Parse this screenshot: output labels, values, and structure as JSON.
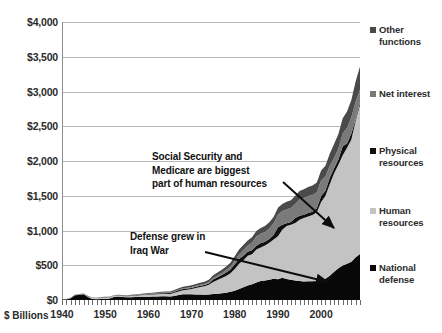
{
  "chart_data": {
    "type": "area",
    "stacked": true,
    "title": "",
    "subtitle": "",
    "xlabel": "",
    "ylabel": "$ Billions",
    "units_label": "$ Billions",
    "grid": true,
    "legend_position": "right",
    "xlim": [
      1940,
      2009
    ],
    "ylim": [
      0,
      4000
    ],
    "ytick_step": 500,
    "ytick_labels": [
      "$4,000",
      "$3,500",
      "$3,000",
      "$2,500",
      "$2,000",
      "$1,500",
      "$1,000",
      "$500",
      "$0"
    ],
    "ytick_values": [
      4000,
      3500,
      3000,
      2500,
      2000,
      1500,
      1000,
      500,
      0
    ],
    "xtick_labels": [
      "1940",
      "1950",
      "1960",
      "1970",
      "1980",
      "1990",
      "2000"
    ],
    "xtick_values": [
      1940,
      1950,
      1960,
      1970,
      1980,
      1990,
      2000
    ],
    "x": [
      1940,
      1941,
      1942,
      1943,
      1944,
      1945,
      1946,
      1947,
      1948,
      1949,
      1950,
      1951,
      1952,
      1953,
      1954,
      1955,
      1956,
      1957,
      1958,
      1959,
      1960,
      1961,
      1962,
      1963,
      1964,
      1965,
      1966,
      1967,
      1968,
      1969,
      1970,
      1971,
      1972,
      1973,
      1974,
      1975,
      1976,
      1977,
      1978,
      1979,
      1980,
      1981,
      1982,
      1983,
      1984,
      1985,
      1986,
      1987,
      1988,
      1989,
      1990,
      1991,
      1992,
      1993,
      1994,
      1995,
      1996,
      1997,
      1998,
      1999,
      2000,
      2001,
      2002,
      2003,
      2004,
      2005,
      2006,
      2007,
      2008,
      2009
    ],
    "series": [
      {
        "name": "National defense",
        "color": "#080808",
        "stack_order": 1,
        "values": [
          2,
          6,
          24,
          63,
          76,
          83,
          43,
          14,
          11,
          13,
          13,
          22,
          44,
          49,
          43,
          40,
          40,
          43,
          45,
          46,
          48,
          49,
          52,
          53,
          55,
          51,
          59,
          72,
          82,
          82,
          82,
          79,
          79,
          77,
          80,
          87,
          90,
          97,
          105,
          118,
          134,
          158,
          185,
          210,
          227,
          253,
          273,
          282,
          290,
          304,
          300,
          320,
          303,
          292,
          282,
          273,
          266,
          271,
          269,
          275,
          295,
          306,
          349,
          405,
          456,
          495,
          522,
          551,
          616,
          661
        ]
      },
      {
        "name": "Human resources",
        "color": "#c3c3c3",
        "stack_order": 2,
        "values": [
          4,
          4,
          3,
          3,
          2,
          2,
          9,
          13,
          13,
          18,
          21,
          13,
          12,
          13,
          14,
          15,
          17,
          19,
          23,
          26,
          26,
          30,
          32,
          33,
          35,
          36,
          44,
          52,
          60,
          67,
          76,
          93,
          109,
          120,
          138,
          173,
          198,
          221,
          242,
          267,
          313,
          362,
          388,
          426,
          432,
          472,
          482,
          503,
          534,
          568,
          619,
          690,
          760,
          792,
          827,
          880,
          913,
          930,
          954,
          987,
          1115,
          1194,
          1318,
          1420,
          1489,
          1586,
          1670,
          1760,
          1962,
          2150
        ]
      },
      {
        "name": "Physical resources",
        "color": "#0f0f0f",
        "stack_order": 3,
        "values": [
          1,
          1,
          1,
          1,
          1,
          1,
          1,
          1,
          1,
          2,
          3,
          3,
          3,
          3,
          3,
          3,
          4,
          5,
          6,
          7,
          8,
          9,
          10,
          11,
          11,
          12,
          14,
          15,
          17,
          17,
          16,
          18,
          18,
          19,
          21,
          35,
          39,
          42,
          49,
          53,
          66,
          70,
          63,
          58,
          57,
          57,
          61,
          54,
          53,
          62,
          126,
          74,
          40,
          39,
          71,
          60,
          47,
          52,
          48,
          58,
          85,
          73,
          92,
          70,
          75,
          131,
          61,
          83,
          26,
          30
        ]
      },
      {
        "name": "Net interest",
        "color": "#7a7a7a",
        "stack_order": 4,
        "values": [
          1,
          1,
          1,
          2,
          2,
          3,
          4,
          4,
          4,
          4,
          4,
          4,
          4,
          5,
          5,
          5,
          5,
          5,
          5,
          6,
          7,
          7,
          7,
          8,
          8,
          8,
          9,
          10,
          11,
          12,
          14,
          14,
          15,
          17,
          21,
          23,
          27,
          30,
          35,
          43,
          53,
          69,
          85,
          90,
          111,
          130,
          136,
          139,
          152,
          169,
          184,
          195,
          199,
          199,
          203,
          232,
          241,
          244,
          241,
          230,
          223,
          206,
          171,
          153,
          160,
          184,
          227,
          237,
          253,
          187
        ]
      },
      {
        "name": "Other functions",
        "color": "#4a4a4a",
        "stack_order": 5,
        "values": [
          1,
          2,
          3,
          5,
          6,
          6,
          5,
          4,
          4,
          5,
          6,
          6,
          7,
          7,
          7,
          7,
          8,
          8,
          9,
          10,
          10,
          11,
          12,
          13,
          14,
          15,
          17,
          19,
          21,
          22,
          23,
          25,
          27,
          29,
          32,
          37,
          41,
          45,
          50,
          55,
          62,
          67,
          70,
          71,
          76,
          81,
          83,
          85,
          88,
          93,
          98,
          104,
          110,
          112,
          118,
          124,
          127,
          130,
          134,
          139,
          145,
          152,
          175,
          195,
          208,
          220,
          232,
          248,
          290,
          333
        ]
      }
    ],
    "annotations": [
      {
        "id": "human-resources-note",
        "text": "Social Security and\nMedicare are biggest\npart of  human resources",
        "arrow_from": [
          283,
          182
        ],
        "arrow_to": [
          334,
          228
        ]
      },
      {
        "id": "defense-note",
        "text": "Defense grew in\nIraq War",
        "arrow_from": [
          205,
          252
        ],
        "arrow_to": [
          328,
          282
        ]
      }
    ]
  },
  "legend": {
    "items": [
      {
        "label": "Other\nfunctions",
        "color": "#4a4a4a",
        "top": 24
      },
      {
        "label": "Net interest",
        "color": "#7a7a7a",
        "top": 88
      },
      {
        "label": "Physical\nresources",
        "color": "#0f0f0f",
        "top": 145
      },
      {
        "label": "Human\nresources",
        "color": "#c3c3c3",
        "top": 205
      },
      {
        "label": "National\ndefense",
        "color": "#080808",
        "top": 262
      }
    ]
  }
}
